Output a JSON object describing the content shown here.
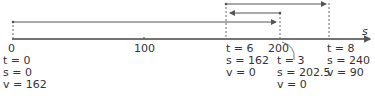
{
  "axis": {
    "label": "s",
    "ticks": [
      {
        "value": "0",
        "x": 12
      },
      {
        "value": "100",
        "x": 144
      },
      {
        "value": "200",
        "x": 280
      }
    ]
  },
  "points": [
    {
      "id": "p0",
      "x": 13,
      "lines": [
        "t = 0",
        "s = 0",
        "v = 162"
      ]
    },
    {
      "id": "p6",
      "x": 226,
      "lines": [
        "t = 6",
        "s = 162",
        "v = 0"
      ]
    },
    {
      "id": "p3",
      "x": 280,
      "lines": [
        "t = 3",
        "s = 202.5",
        "v = 0"
      ]
    },
    {
      "id": "p8",
      "x": 329,
      "lines": [
        "t = 8",
        "s = 240",
        "v = 90"
      ]
    }
  ],
  "colors": {
    "line": "#555555",
    "text": "#333333"
  }
}
